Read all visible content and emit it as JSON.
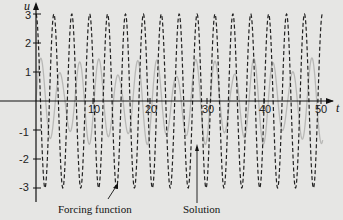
{
  "chart_data": {
    "type": "line",
    "title": "",
    "xlabel": "t",
    "ylabel": "u",
    "xlim": [
      0,
      52
    ],
    "ylim": [
      -3.4,
      3.4
    ],
    "x_ticks": [
      10,
      20,
      30,
      40,
      50
    ],
    "y_ticks": [
      -3,
      -2,
      -1,
      1,
      2,
      3
    ],
    "grid": false,
    "series": [
      {
        "name": "Solution",
        "style": "dashed",
        "color": "#222222",
        "description": "modeled as u ≈ 3 cos(2t), period ≈ π, amplitude 3",
        "amplitude": 3,
        "period": 3.14,
        "x": [
          0,
          1.57,
          3.14,
          4.71,
          6.28,
          7.85,
          9.42,
          11.0,
          12.57,
          14.14,
          15.71,
          17.28,
          18.85,
          20.42,
          21.99,
          23.56,
          25.13,
          26.7,
          28.27,
          29.85,
          31.42,
          32.99,
          34.56,
          36.13,
          37.7,
          39.27,
          40.84,
          42.41,
          43.98,
          45.55,
          47.12,
          48.69,
          50.27
        ],
        "values": [
          3,
          -3,
          3,
          -3,
          3,
          -3,
          3,
          -3,
          3,
          -3,
          3,
          -3,
          3,
          -3,
          3,
          -3,
          3,
          -3,
          3,
          -3,
          3,
          -3,
          3,
          -3,
          3,
          -3,
          3,
          -3,
          3,
          -3,
          3,
          -3,
          3
        ]
      },
      {
        "name": "Forcing function",
        "style": "solid-light",
        "color": "#b8b8b6",
        "description": "modeled as a faint gray curve with a beat pattern, amplitude ≈ 1.5",
        "amplitude": 1.5
      }
    ],
    "annotations": [
      {
        "text": "Forcing function",
        "points_to_t": 14.2,
        "points_to_u": -2.9
      },
      {
        "text": "Solution",
        "points_to_t": 26.5,
        "points_to_u": -1.0
      }
    ]
  },
  "labels": {
    "x_axis": "t",
    "y_axis": "u",
    "x_ticks": [
      "10",
      "20",
      "30",
      "40",
      "50"
    ],
    "y_ticks": [
      "3",
      "2",
      "1",
      "-1",
      "-2",
      "-3"
    ],
    "forcing_label": "Forcing function",
    "solution_label": "Solution"
  }
}
